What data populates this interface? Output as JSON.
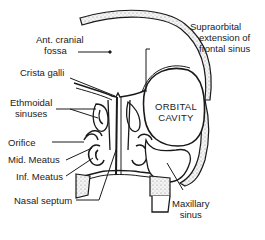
{
  "diagram": {
    "type": "anatomical cross-section (coronal) of nasal cavity and paranasal sinuses",
    "labels": {
      "ant_cranial_fossa": [
        "Ant. cranial",
        "fossa"
      ],
      "supraorbital": [
        "Supraorbital",
        "extension of",
        "frontal sinus"
      ],
      "crista_galli": "Crista galli",
      "ethmoidal_sinuses": [
        "Ethmoidal",
        "sinuses"
      ],
      "orbital_cavity": [
        "ORBITAL",
        "CAVITY"
      ],
      "orifice": "Orifice",
      "mid_meatus": "Mid. Meatus",
      "inf_meatus": "Inf. Meatus",
      "nasal_septum": "Nasal septum",
      "maxillary_sinus": [
        "Maxillary",
        "sinus"
      ]
    },
    "colors": {
      "line": "#1a1a1a",
      "bone_stipple": "#e9e9e9",
      "background": "#ffffff"
    }
  }
}
